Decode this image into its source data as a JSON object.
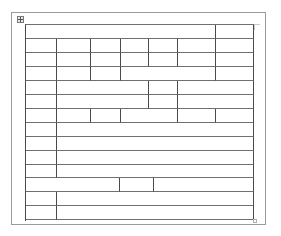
{
  "document": {
    "page": {
      "background": "#ffffff",
      "border_color": "#9a9a9a"
    },
    "table": {
      "move_handle_icon": "table-move-handle-icon",
      "resize_handle_icon": "table-resize-handle-icon",
      "line_color": "#4a4a4a",
      "column_edges": [
        25,
        57,
        91,
        121,
        149,
        178,
        216,
        254
      ],
      "row_edges": [
        24,
        39,
        53,
        67,
        81,
        95,
        109,
        123,
        137,
        151,
        165,
        178,
        192,
        206,
        220
      ],
      "rows": [
        {
          "cells": [
            {
              "x1": 25,
              "x2": 216,
              "text": ""
            },
            {
              "x1": 216,
              "x2": 254,
              "text": ""
            }
          ]
        },
        {
          "cells": [
            {
              "x1": 25,
              "x2": 57,
              "text": ""
            },
            {
              "x1": 57,
              "x2": 91,
              "text": ""
            },
            {
              "x1": 91,
              "x2": 121,
              "text": ""
            },
            {
              "x1": 121,
              "x2": 149,
              "text": ""
            },
            {
              "x1": 149,
              "x2": 178,
              "text": ""
            },
            {
              "x1": 178,
              "x2": 216,
              "text": ""
            },
            {
              "x1": 216,
              "x2": 254,
              "text": ""
            }
          ]
        },
        {
          "cells": [
            {
              "x1": 25,
              "x2": 57,
              "text": ""
            },
            {
              "x1": 57,
              "x2": 91,
              "text": ""
            },
            {
              "x1": 91,
              "x2": 121,
              "text": ""
            },
            {
              "x1": 121,
              "x2": 149,
              "text": ""
            },
            {
              "x1": 149,
              "x2": 178,
              "text": ""
            },
            {
              "x1": 178,
              "x2": 216,
              "text": ""
            },
            {
              "x1": 216,
              "x2": 254,
              "text": ""
            }
          ]
        },
        {
          "cells": [
            {
              "x1": 25,
              "x2": 57,
              "text": ""
            },
            {
              "x1": 57,
              "x2": 91,
              "text": ""
            },
            {
              "x1": 91,
              "x2": 121,
              "text": ""
            },
            {
              "x1": 121,
              "x2": 216,
              "text": ""
            },
            {
              "x1": 216,
              "x2": 254,
              "text": ""
            }
          ]
        },
        {
          "cells": [
            {
              "x1": 25,
              "x2": 57,
              "text": ""
            },
            {
              "x1": 57,
              "x2": 149,
              "text": ""
            },
            {
              "x1": 149,
              "x2": 178,
              "text": ""
            },
            {
              "x1": 178,
              "x2": 254,
              "text": ""
            }
          ]
        },
        {
          "cells": [
            {
              "x1": 25,
              "x2": 57,
              "text": ""
            },
            {
              "x1": 57,
              "x2": 149,
              "text": ""
            },
            {
              "x1": 149,
              "x2": 178,
              "text": ""
            },
            {
              "x1": 178,
              "x2": 254,
              "text": ""
            }
          ]
        },
        {
          "cells": [
            {
              "x1": 25,
              "x2": 57,
              "text": ""
            },
            {
              "x1": 57,
              "x2": 91,
              "text": ""
            },
            {
              "x1": 91,
              "x2": 121,
              "text": ""
            },
            {
              "x1": 121,
              "x2": 178,
              "text": ""
            },
            {
              "x1": 178,
              "x2": 216,
              "text": ""
            },
            {
              "x1": 216,
              "x2": 254,
              "text": ""
            }
          ]
        },
        {
          "cells": [
            {
              "x1": 25,
              "x2": 57,
              "text": ""
            },
            {
              "x1": 57,
              "x2": 254,
              "text": ""
            }
          ]
        },
        {
          "cells": [
            {
              "x1": 25,
              "x2": 57,
              "text": ""
            },
            {
              "x1": 57,
              "x2": 254,
              "text": ""
            }
          ]
        },
        {
          "cells": [
            {
              "x1": 25,
              "x2": 57,
              "text": ""
            },
            {
              "x1": 57,
              "x2": 254,
              "text": ""
            }
          ]
        },
        {
          "cells": [
            {
              "x1": 25,
              "x2": 57,
              "text": ""
            },
            {
              "x1": 57,
              "x2": 254,
              "text": ""
            }
          ]
        },
        {
          "cells": [
            {
              "x1": 25,
              "x2": 120,
              "text": ""
            },
            {
              "x1": 120,
              "x2": 154,
              "text": ""
            },
            {
              "x1": 154,
              "x2": 254,
              "text": ""
            }
          ]
        },
        {
          "cells": [
            {
              "x1": 25,
              "x2": 57,
              "text": ""
            },
            {
              "x1": 57,
              "x2": 254,
              "text": ""
            }
          ]
        },
        {
          "cells": [
            {
              "x1": 25,
              "x2": 57,
              "text": ""
            },
            {
              "x1": 57,
              "x2": 254,
              "text": ""
            }
          ]
        }
      ]
    }
  }
}
